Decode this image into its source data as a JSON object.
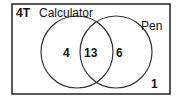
{
  "diagram": {
    "type": "venn",
    "class_label": "4T",
    "sets": [
      {
        "name": "Calculator",
        "only": "4"
      },
      {
        "name": "Pen",
        "only": "6"
      }
    ],
    "intersection": "13",
    "outside": "1"
  }
}
